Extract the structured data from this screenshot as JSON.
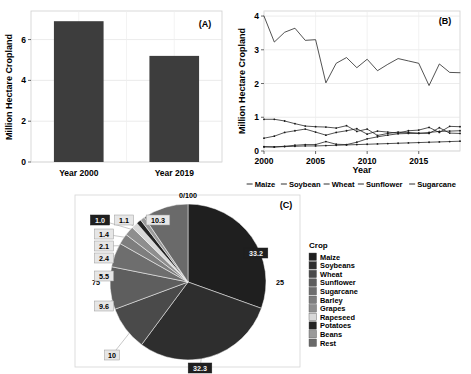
{
  "figure": {
    "panels": [
      {
        "id": "A",
        "label": "(A)"
      },
      {
        "id": "B",
        "label": "(B)"
      },
      {
        "id": "C",
        "label": "(C)"
      }
    ]
  },
  "panel_a": {
    "label": "(A)",
    "ylabel": "Million Hectare Cropland",
    "bar_color": "#3d3d3d",
    "ticks": [
      "0",
      "2",
      "4",
      "6"
    ],
    "categories": [
      "Year 2000",
      "Year 2019"
    ]
  },
  "panel_b": {
    "label": "(B)",
    "ylabel": "Million Hectare Cropland",
    "xlabel": "Year",
    "yticks": [
      "0",
      "1",
      "2",
      "3",
      "4"
    ],
    "xticks": [
      "2000",
      "2005",
      "2010",
      "2015"
    ],
    "legend": [
      "Maize",
      "Soybean",
      "Wheat",
      "Sunflower",
      "Sugarcane"
    ]
  },
  "panel_c": {
    "label": "(C)",
    "legend_title": "Crop",
    "axis_labels": [
      "0/100",
      "25",
      "75"
    ],
    "legend": [
      {
        "name": "Maize",
        "color": "#1f1f1f"
      },
      {
        "name": "Soybeans",
        "color": "#2e2e2e"
      },
      {
        "name": "Wheat",
        "color": "#4a4a4a"
      },
      {
        "name": "Sunflower",
        "color": "#5e5e5e"
      },
      {
        "name": "Sugarcane",
        "color": "#6e6e6e"
      },
      {
        "name": "Barley",
        "color": "#7e7e7e"
      },
      {
        "name": "Grapes",
        "color": "#8e8e8e"
      },
      {
        "name": "Rapeseed",
        "color": "#d8d8d8"
      },
      {
        "name": "Potatoes",
        "color": "#242424"
      },
      {
        "name": "Beans",
        "color": "#9a9a9a"
      },
      {
        "name": "Rest",
        "color": "#6a6a6a"
      }
    ],
    "slice_labels": [
      {
        "value": "33.2",
        "inverted": true
      },
      {
        "value": "32.3",
        "inverted": true
      },
      {
        "value": "10",
        "inverted": false
      },
      {
        "value": "9.6",
        "inverted": false
      },
      {
        "value": "5.5",
        "inverted": false
      },
      {
        "value": "2.4",
        "inverted": false
      },
      {
        "value": "2.1",
        "inverted": false
      },
      {
        "value": "1.4",
        "inverted": false
      },
      {
        "value": "1.1",
        "inverted": false
      },
      {
        "value": "1.0",
        "inverted": true
      },
      {
        "value": "10.3",
        "inverted": false
      }
    ]
  },
  "chart_data": [
    {
      "type": "bar",
      "panel": "A",
      "title": "",
      "xlabel": "",
      "ylabel": "Million Hectare Cropland",
      "categories": [
        "Year 2000",
        "Year 2019"
      ],
      "values": [
        6.9,
        5.2
      ],
      "ylim": [
        0,
        7.4
      ],
      "yticks": [
        0,
        2,
        4,
        6
      ],
      "grid": true,
      "legend": "none",
      "bar_color": "#3d3d3d"
    },
    {
      "type": "line",
      "panel": "B",
      "title": "",
      "xlabel": "Year",
      "ylabel": "Million Hectare Cropland",
      "x": [
        2000,
        2001,
        2002,
        2003,
        2004,
        2005,
        2006,
        2007,
        2008,
        2009,
        2010,
        2011,
        2012,
        2013,
        2014,
        2015,
        2016,
        2017,
        2018,
        2019
      ],
      "xlim": [
        2000,
        2019
      ],
      "ylim": [
        0,
        4.15
      ],
      "yticks": [
        0,
        1,
        2,
        3,
        4
      ],
      "xticks": [
        2000,
        2005,
        2010,
        2015
      ],
      "grid": true,
      "legend_position": "bottom",
      "series": [
        {
          "name": "Maize",
          "values": [
            4.0,
            3.23,
            3.52,
            3.64,
            3.28,
            3.3,
            2.02,
            2.6,
            2.77,
            2.47,
            2.72,
            2.38,
            2.57,
            2.74,
            2.67,
            2.6,
            1.94,
            2.58,
            2.33,
            2.32
          ]
        },
        {
          "name": "Soybean",
          "values": [
            0.38,
            0.44,
            0.55,
            0.6,
            0.65,
            0.56,
            0.47,
            0.55,
            0.6,
            0.66,
            0.5,
            0.59,
            0.56,
            0.53,
            0.6,
            0.62,
            0.7,
            0.55,
            0.73,
            0.72
          ]
        },
        {
          "name": "Wheat",
          "values": [
            0.94,
            0.94,
            0.89,
            0.81,
            0.74,
            0.72,
            0.71,
            0.68,
            0.75,
            0.58,
            0.65,
            0.46,
            0.52,
            0.56,
            0.55,
            0.53,
            0.52,
            0.69,
            0.53,
            0.52
          ]
        },
        {
          "name": "Sunflower",
          "values": [
            0.13,
            0.12,
            0.14,
            0.17,
            0.19,
            0.19,
            0.28,
            0.2,
            0.19,
            0.26,
            0.36,
            0.42,
            0.47,
            0.51,
            0.52,
            0.52,
            0.55,
            0.58,
            0.59,
            0.6
          ]
        },
        {
          "name": "Sugarcane",
          "values": [
            0.12,
            0.12,
            0.13,
            0.14,
            0.15,
            0.15,
            0.16,
            0.17,
            0.18,
            0.19,
            0.2,
            0.21,
            0.22,
            0.23,
            0.24,
            0.25,
            0.26,
            0.27,
            0.28,
            0.29
          ]
        }
      ]
    },
    {
      "type": "pie",
      "panel": "C",
      "title": "",
      "legend_title": "Crop",
      "legend_position": "right",
      "labels": [
        "Maize",
        "Soybeans",
        "Wheat",
        "Sunflower",
        "Sugarcane",
        "Barley",
        "Grapes",
        "Rapeseed",
        "Potatoes",
        "Beans",
        "Rest"
      ],
      "values": [
        33.2,
        32.3,
        10.0,
        9.6,
        5.5,
        2.4,
        2.1,
        1.4,
        1.1,
        1.0,
        10.3
      ],
      "unit": "percent",
      "axis_labels": [
        "0/100",
        "25",
        "75"
      ]
    }
  ]
}
